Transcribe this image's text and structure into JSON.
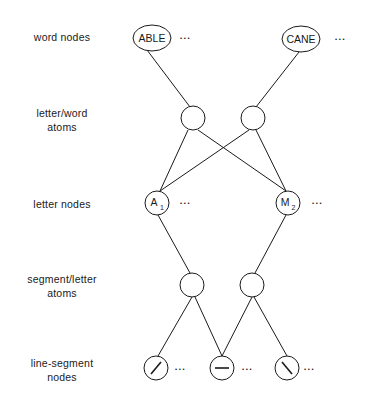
{
  "diagram": {
    "level_labels": [
      {
        "id": "word-nodes",
        "text": "word nodes"
      },
      {
        "id": "letter-word-atoms",
        "text": "letter/word\natoms"
      },
      {
        "id": "letter-nodes",
        "text": "letter nodes"
      },
      {
        "id": "segment-letter-atoms",
        "text": "segment/letter\natoms"
      },
      {
        "id": "line-segment-nodes",
        "text": "line-segment\nnodes"
      }
    ],
    "word_nodes": [
      {
        "label": "ABLE"
      },
      {
        "label": "CANE"
      }
    ],
    "letter_nodes": [
      {
        "letter": "A",
        "subscript": "1"
      },
      {
        "letter": "M",
        "subscript": "2"
      }
    ],
    "line_segment_nodes": [
      {
        "orientation": "diagonal-up"
      },
      {
        "orientation": "horizontal"
      },
      {
        "orientation": "diagonal-down"
      }
    ],
    "ellipsis": "• • •",
    "colors": {
      "stroke": "#1a1a1a",
      "background": "#ffffff"
    }
  }
}
